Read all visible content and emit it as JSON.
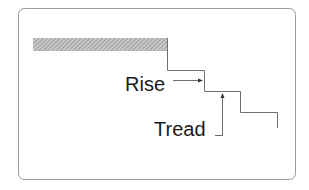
{
  "diagram": {
    "type": "stair-profile",
    "labels": {
      "rise": "Rise",
      "tread": "Tread"
    },
    "colors": {
      "frame": "#8a8a8a",
      "line": "#6a6a6a",
      "text": "#1a1a1a",
      "hatch": "#9a9a9a",
      "background": "#ffffff"
    }
  }
}
